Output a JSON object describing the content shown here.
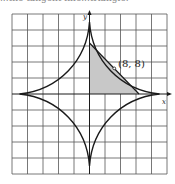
{
  "figure": {
    "caption_fragment": "...the tangent line...triangle.",
    "axis_labels": {
      "x": "x",
      "y": "y"
    },
    "point_label": "(8, 8)",
    "point": [
      8,
      8
    ],
    "curve": "astroid x^(2/3) + y^(2/3) = 8",
    "tangent_line": "x + y = 16",
    "grid": {
      "columns": 10,
      "rows": 10,
      "units_per_square": 5
    },
    "colors": {
      "curve": "#1a1a1a",
      "grid": "#555555",
      "shade": "#c8c8c8"
    }
  }
}
